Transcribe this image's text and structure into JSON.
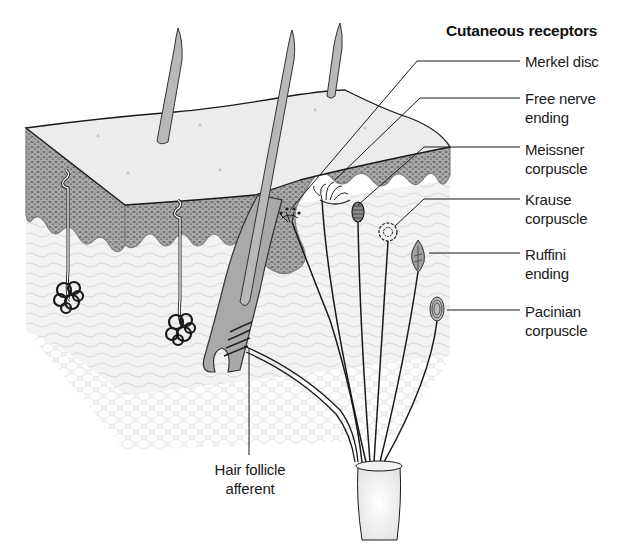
{
  "figure": {
    "title": "Cutaneous receptors",
    "colors": {
      "background": "#ffffff",
      "line": "#1a1a1a",
      "epidermis": "#9a9a9a",
      "surface": "#ececec",
      "dermis": "#f2f2f2",
      "hypodermis": "#f6f6f6"
    }
  },
  "labels": {
    "merkel": {
      "line1": "Merkel disc",
      "line2": ""
    },
    "free_nerve": {
      "line1": "Free nerve",
      "line2": "ending"
    },
    "meissner": {
      "line1": "Meissner",
      "line2": "corpuscle"
    },
    "krause": {
      "line1": "Krause",
      "line2": "corpuscle"
    },
    "ruffini": {
      "line1": "Ruffini",
      "line2": "ending"
    },
    "pacinian": {
      "line1": "Pacinian",
      "line2": "corpuscle"
    },
    "hair_follicle": {
      "line1": "Hair follicle",
      "line2": "afferent"
    }
  }
}
